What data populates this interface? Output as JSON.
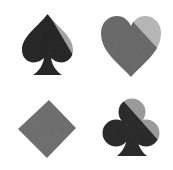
{
  "icons": [
    {
      "name": "spade",
      "dark": "#2a2a2a",
      "light": "#a8a8a8"
    },
    {
      "name": "heart",
      "dark": "#6e6e6e",
      "light": "#bdbdbd"
    },
    {
      "name": "diamond",
      "dark": "#737373",
      "light": "#c2c2c2"
    },
    {
      "name": "club",
      "dark": "#2e2e2e",
      "light": "#a0a0a0"
    }
  ],
  "background": "#ffffff"
}
